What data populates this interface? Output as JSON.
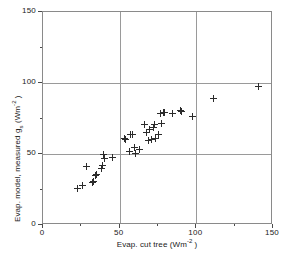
{
  "chart_data": {
    "type": "scatter",
    "title": "",
    "xlabel": "Evap. cut tree (Wm-2)",
    "ylabel": "Evap. model, measured gs (Wm-2)",
    "xlim": [
      0,
      150
    ],
    "ylim": [
      0,
      150
    ],
    "xticks": [
      0,
      50,
      100,
      150
    ],
    "yticks": [
      0,
      50,
      100,
      150
    ],
    "xtick_labels": [
      "0",
      "50",
      "100",
      "150"
    ],
    "ytick_labels": [
      "0",
      "50",
      "100",
      "150"
    ],
    "minor_tick_interval": 25,
    "grid": true,
    "gridlines_x": [
      50,
      100
    ],
    "gridlines_y": [
      50,
      100
    ],
    "legend": null,
    "marker": "plus",
    "marker_color": "#2b2b2b",
    "points": [
      {
        "x": 22.5,
        "y": 26.0
      },
      {
        "x": 26.0,
        "y": 28.0
      },
      {
        "x": 28.5,
        "y": 41.0
      },
      {
        "x": 32.0,
        "y": 30.0
      },
      {
        "x": 33.0,
        "y": 30.5
      },
      {
        "x": 34.5,
        "y": 35.0
      },
      {
        "x": 35.0,
        "y": 35.5
      },
      {
        "x": 38.0,
        "y": 40.0
      },
      {
        "x": 38.5,
        "y": 42.0
      },
      {
        "x": 39.5,
        "y": 50.0
      },
      {
        "x": 40.0,
        "y": 46.5
      },
      {
        "x": 45.5,
        "y": 47.5
      },
      {
        "x": 53.0,
        "y": 61.0
      },
      {
        "x": 53.5,
        "y": 60.5
      },
      {
        "x": 56.5,
        "y": 52.0
      },
      {
        "x": 57.0,
        "y": 63.5
      },
      {
        "x": 58.5,
        "y": 63.5
      },
      {
        "x": 59.5,
        "y": 54.5
      },
      {
        "x": 60.0,
        "y": 50.5
      },
      {
        "x": 63.0,
        "y": 53.0
      },
      {
        "x": 66.5,
        "y": 71.0
      },
      {
        "x": 67.5,
        "y": 65.0
      },
      {
        "x": 68.5,
        "y": 59.5
      },
      {
        "x": 69.5,
        "y": 67.0
      },
      {
        "x": 70.5,
        "y": 60.5
      },
      {
        "x": 72.0,
        "y": 68.5
      },
      {
        "x": 73.0,
        "y": 70.5
      },
      {
        "x": 73.5,
        "y": 61.0
      },
      {
        "x": 75.0,
        "y": 63.5
      },
      {
        "x": 76.5,
        "y": 78.5
      },
      {
        "x": 77.5,
        "y": 71.5
      },
      {
        "x": 78.5,
        "y": 79.0
      },
      {
        "x": 79.5,
        "y": 79.0
      },
      {
        "x": 84.5,
        "y": 78.5
      },
      {
        "x": 89.5,
        "y": 80.5
      },
      {
        "x": 90.0,
        "y": 80.0
      },
      {
        "x": 97.5,
        "y": 76.5
      },
      {
        "x": 111.0,
        "y": 89.0
      },
      {
        "x": 140.5,
        "y": 97.5
      }
    ]
  },
  "axes": {
    "x_title_main": "Evap. cut tree (Wm",
    "x_title_sup": "-2",
    "x_title_tail": ")",
    "y_title_p1": "Evap. model, measured g",
    "y_title_sub": "s",
    "y_title_p2": " (Wm",
    "y_title_sup": "-2",
    "y_title_tail": ")"
  }
}
